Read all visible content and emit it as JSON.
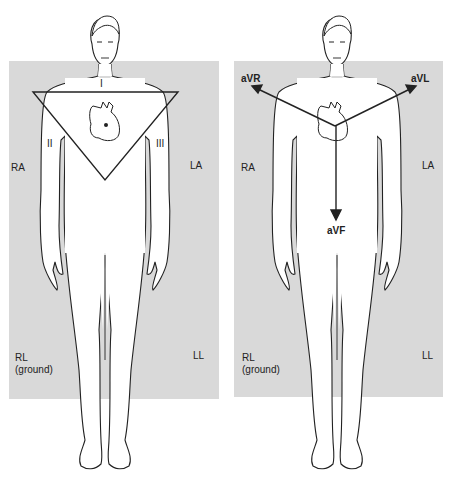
{
  "figures": [
    {
      "id": "bipolar-limb-leads",
      "leads": [
        "I",
        "II",
        "III"
      ],
      "electrodes": {
        "right_arm": "RA",
        "left_arm": "LA",
        "right_leg": "RL",
        "right_leg_note": "(ground)",
        "left_leg": "LL"
      }
    },
    {
      "id": "augmented-limb-leads",
      "leads": [
        "aVR",
        "aVL",
        "aVF"
      ],
      "electrodes": {
        "right_arm": "RA",
        "left_arm": "LA",
        "right_leg": "RL",
        "right_leg_note": "(ground)",
        "left_leg": "LL"
      }
    }
  ],
  "colors": {
    "panel": "#d9d9d9",
    "line": "#222222",
    "body": "#ffffff"
  }
}
